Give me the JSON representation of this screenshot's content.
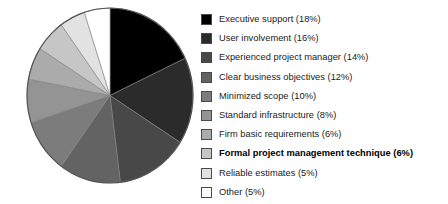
{
  "chart_data": {
    "type": "pie",
    "title": "",
    "subtitle": "",
    "xlabel": "",
    "ylabel": "",
    "legend_position": "right",
    "grid": false,
    "start_angle_deg": 0,
    "direction": "clockwise",
    "units": "percent",
    "categories": [
      "Executive support",
      "User involvement",
      "Experienced project manager",
      "Clear business objectives",
      "Minimized scope",
      "Standard infrastructure",
      "Firm basic requirements",
      "Formal project management technique",
      "Reliable estimates",
      "Other"
    ],
    "values": [
      18,
      16,
      14,
      12,
      10,
      8,
      6,
      6,
      5,
      5
    ],
    "colors": [
      "#000000",
      "#2b2b2b",
      "#484848",
      "#636363",
      "#7c7c7c",
      "#949494",
      "#ababab",
      "#c6c6c6",
      "#e2e2e2",
      "#ffffff"
    ],
    "slice_outline_color": "#808080",
    "pie_outline_color": "#555555"
  },
  "legend": {
    "items": [
      {
        "label": "Executive support (18%)",
        "color": "#000000",
        "emphasis": false
      },
      {
        "label": "User involvement (16%)",
        "color": "#2b2b2b",
        "emphasis": false
      },
      {
        "label": "Experienced project manager (14%)",
        "color": "#484848",
        "emphasis": false
      },
      {
        "label": "Clear business objectives (12%)",
        "color": "#636363",
        "emphasis": false
      },
      {
        "label": "Minimized scope (10%)",
        "color": "#7c7c7c",
        "emphasis": false
      },
      {
        "label": "Standard infrastructure (8%)",
        "color": "#949494",
        "emphasis": false
      },
      {
        "label": "Firm basic requirements (6%)",
        "color": "#ababab",
        "emphasis": false
      },
      {
        "label": "Formal project management technique (6%)",
        "color": "#c6c6c6",
        "emphasis": true
      },
      {
        "label": "Reliable estimates (5%)",
        "color": "#e2e2e2",
        "emphasis": false
      },
      {
        "label": "Other (5%)",
        "color": "#ffffff",
        "emphasis": false
      }
    ]
  }
}
